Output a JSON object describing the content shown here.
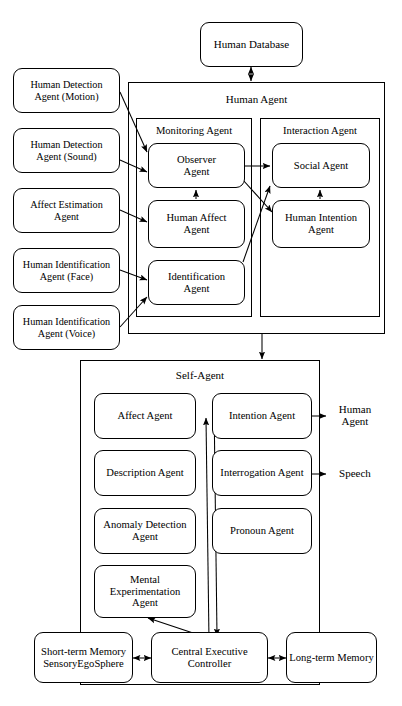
{
  "diagram": {
    "stroke_color": "#000000",
    "background_color": "#ffffff"
  },
  "top": {
    "human_database": "Human Database"
  },
  "sensors": [
    {
      "label": "Human Detection\nAgent (Motion)",
      "line1": "Human Detection",
      "line2": "Agent (Motion)"
    },
    {
      "label": "Human Detection\nAgent (Sound)",
      "line1": "Human Detection",
      "line2": "Agent (Sound)"
    },
    {
      "label": "Affect Estimation\nAgent",
      "line1": "Affect Estimation",
      "line2": "Agent"
    },
    {
      "label": "Human Identification\nAgent (Face)",
      "line1": "Human Identification",
      "line2": "Agent (Face)"
    },
    {
      "label": "Human Identification\nAgent (Voice)",
      "line1": "Human Identification",
      "line2": "Agent (Voice)"
    }
  ],
  "human_agent": {
    "title": "Human Agent",
    "monitoring": {
      "title": "Monitoring Agent",
      "agents": [
        {
          "line1": "Observer",
          "line2": "Agent"
        },
        {
          "line1": "Human Affect",
          "line2": "Agent"
        },
        {
          "line1": "Identification",
          "line2": "Agent"
        }
      ]
    },
    "interaction": {
      "title": "Interaction Agent",
      "agents": [
        {
          "line1": "Social Agent",
          "line2": ""
        },
        {
          "line1": "Human Intention",
          "line2": "Agent"
        }
      ]
    }
  },
  "self_agent": {
    "title": "Self-Agent",
    "left_agents": [
      {
        "line1": "Affect Agent",
        "line2": ""
      },
      {
        "line1": "Description Agent",
        "line2": ""
      },
      {
        "line1": "Anomaly Detection",
        "line2": "Agent"
      },
      {
        "line1": "Mental",
        "line2": "Experimentation",
        "line3": "Agent"
      }
    ],
    "right_agents": [
      {
        "line1": "Intention Agent",
        "line2": ""
      },
      {
        "line1": "Interrogation Agent",
        "line2": ""
      },
      {
        "line1": "Pronoun Agent",
        "line2": ""
      }
    ]
  },
  "external_labels": {
    "human_agent_out": {
      "line1": "Human",
      "line2": "Agent"
    },
    "speech_out": {
      "line1": "Speech",
      "line2": ""
    }
  },
  "memory": {
    "short_term": {
      "line1": "Short-term Memory",
      "line2": "SensoryEgoSphere"
    },
    "controller": {
      "line1": "Central Executive",
      "line2": "Controller"
    },
    "long_term": {
      "line1": "Long-term Memory",
      "line2": ""
    }
  }
}
